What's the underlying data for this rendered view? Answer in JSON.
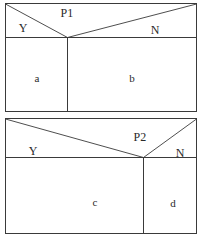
{
  "figure": {
    "width": 204,
    "height": 243,
    "background_color": "#ffffff",
    "line_color": "#3a3a3a",
    "text_color": "#2a2a2a"
  },
  "panels": [
    {
      "id": "panel-top",
      "frame": {
        "x": 5,
        "y": 3,
        "width": 192,
        "height": 109
      },
      "split_line_y": 37,
      "vertex": {
        "x": 67,
        "y": 37
      },
      "vertical_divider_x": 67,
      "node_label": {
        "text": "P1",
        "x": 67,
        "y": 13
      },
      "branch_labels": [
        {
          "text": "Y",
          "x": 23,
          "y": 28
        },
        {
          "text": "N",
          "x": 155,
          "y": 30
        }
      ],
      "leaf_labels": [
        {
          "text": "a",
          "x": 37,
          "y": 78
        },
        {
          "text": "b",
          "x": 132,
          "y": 78
        }
      ]
    },
    {
      "id": "panel-bottom",
      "frame": {
        "x": 5,
        "y": 118,
        "width": 192,
        "height": 116
      },
      "split_line_y": 157,
      "vertex": {
        "x": 143,
        "y": 157
      },
      "vertical_divider_x": 143,
      "node_label": {
        "text": "P2",
        "x": 140,
        "y": 137
      },
      "branch_labels": [
        {
          "text": "Y",
          "x": 33,
          "y": 151
        },
        {
          "text": "N",
          "x": 180,
          "y": 153
        }
      ],
      "leaf_labels": [
        {
          "text": "c",
          "x": 95,
          "y": 202
        },
        {
          "text": "d",
          "x": 173,
          "y": 203
        }
      ]
    }
  ],
  "labels": {
    "p1": "P1",
    "p2": "P2",
    "top_yes": "Y",
    "top_no": "N",
    "bottom_yes": "Y",
    "bottom_no": "N",
    "leaf_a": "a",
    "leaf_b": "b",
    "leaf_c": "c",
    "leaf_d": "d"
  }
}
